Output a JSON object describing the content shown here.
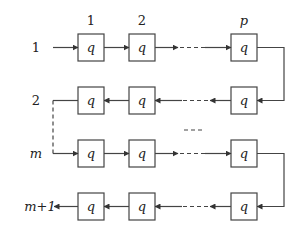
{
  "diagram": {
    "cell_label": "q",
    "column_labels": [
      "1",
      "2",
      "p"
    ],
    "row_labels": [
      "1",
      "2",
      "m",
      "m+1"
    ],
    "row_label_italic": [
      false,
      false,
      true,
      true
    ],
    "column_label_italic": [
      false,
      false,
      true
    ],
    "rows": [
      {
        "label": "1",
        "direction": "right",
        "cells": [
          "q",
          "q",
          "q"
        ]
      },
      {
        "label": "2",
        "direction": "left",
        "cells": [
          "q",
          "q",
          "q"
        ]
      },
      {
        "label": "m",
        "direction": "right",
        "cells": [
          "q",
          "q",
          "q"
        ]
      },
      {
        "label": "m+1",
        "direction": "left",
        "cells": [
          "q",
          "q",
          "q"
        ]
      }
    ],
    "ellipsis_between_rows": "---"
  }
}
